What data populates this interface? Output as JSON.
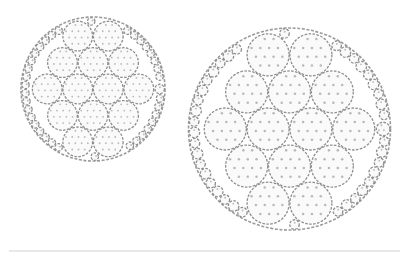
{
  "figure": {
    "packings": [
      {
        "id": "small-packing",
        "large_circle_rows": [
          2,
          3,
          4,
          3,
          2
        ],
        "large_circle_count": 14,
        "fill_circles": "border gap fillers",
        "style": "dashed outline with dotted interior"
      },
      {
        "id": "large-packing",
        "large_circle_rows": [
          2,
          3,
          4,
          3,
          2
        ],
        "large_circle_count": 14,
        "fill_circles": "border gap fillers",
        "style": "dashed outline with dotted interior"
      }
    ],
    "colors": {
      "outline": "#9a9a9a",
      "dots": "#b9b9b9",
      "baseline": "#d2d2d2",
      "background": "#ffffff"
    }
  }
}
